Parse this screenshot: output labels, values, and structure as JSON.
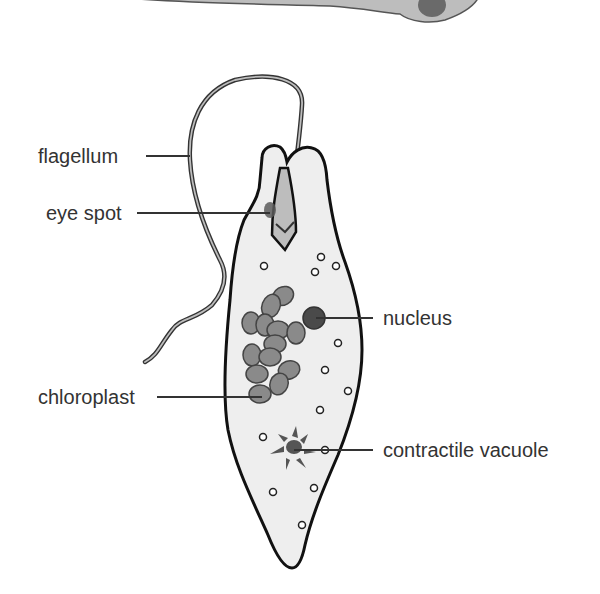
{
  "diagram": {
    "labels": {
      "flagellum": "flagellum",
      "eye_spot": "eye spot",
      "nucleus": "nucleus",
      "chloroplast": "chloroplast",
      "contractile_vacuole": "contractile vacuole"
    },
    "colors": {
      "outline": "#111111",
      "cytoplasm": "#eeeeee",
      "chloroplast_fill": "#8a8a8a",
      "nucleus_fill": "#4a4a4a",
      "eye_spot_fill": "#5a5a5a",
      "reservoir_fill": "#bdbdbd",
      "leader_line": "#333333",
      "label_text": "#333333"
    }
  }
}
